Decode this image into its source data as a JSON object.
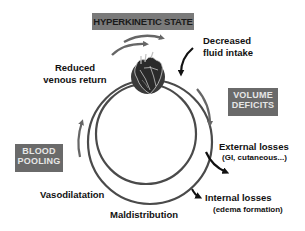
{
  "diagram": {
    "boxes": {
      "hyperkinetic": "HYPERKINETIC STATE",
      "volume_deficits": [
        "VOLUME",
        "DEFICITS"
      ],
      "blood_pooling": [
        "BLOOD",
        "POOLING"
      ]
    },
    "labels": {
      "reduced_venous_return": [
        "Reduced",
        "venous return"
      ],
      "decreased_fluid_intake": [
        "Decreased",
        "fluid intake"
      ],
      "external_losses": "External losses",
      "external_losses_detail": "(GI, cutaneous...)",
      "internal_losses": "Internal losses",
      "internal_losses_detail": "(edema formation)",
      "vasodilatation": "Vasodilatation",
      "maldistribution": "Maldistribution"
    },
    "icons": {
      "center_top": "heart-illustration-icon"
    },
    "colors": {
      "box_fill": "#6a6a6a",
      "box_text": "#e6e6e6",
      "circle_stroke": "#4a4a4a",
      "arrow_gray": "#666666",
      "arrow_black": "#111111",
      "heart_disc": "#3a3a3a"
    }
  }
}
